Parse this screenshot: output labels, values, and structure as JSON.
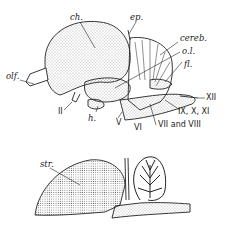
{
  "figure": {
    "top_view": {
      "name": "brain lateral view",
      "labels": {
        "ch": "ch.",
        "ep": "ep.",
        "cereb": "cereb.",
        "ol": "o.l.",
        "fl": "fl.",
        "olf": "olf.",
        "ii": "II",
        "h": "h.",
        "v": "V",
        "vi": "VI",
        "vii_viii": "VII and VIII",
        "ix_x_xi": "IX, X, XI",
        "xii": "XII"
      }
    },
    "bottom_view": {
      "name": "brain sagittal section",
      "labels": {
        "str": "str."
      }
    }
  }
}
